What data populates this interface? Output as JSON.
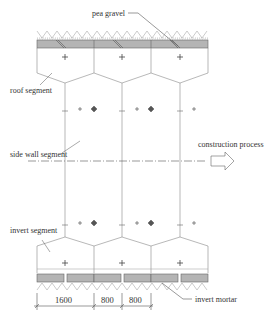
{
  "labels": {
    "pea_gravel": "pea gravel",
    "roof_segment": "roof segment",
    "side_wall_segment": "side wall segment",
    "construction_process": "construction process",
    "invert_segment": "invert segment",
    "invert_mortar": "invert mortar"
  },
  "dimensions": [
    "1600",
    "800",
    "800"
  ],
  "colors": {
    "line": "#777777",
    "slab_fill": "#b4b4b4",
    "text": "#333333"
  }
}
